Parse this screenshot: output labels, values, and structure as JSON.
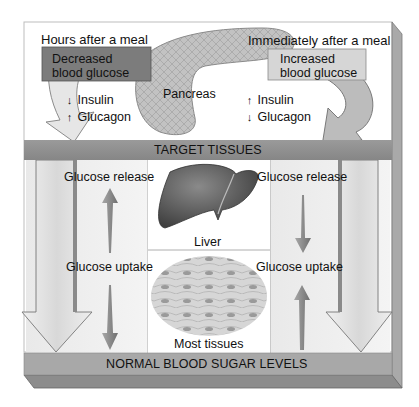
{
  "diagram": {
    "top_left_caption": "Hours after a meal",
    "top_right_caption": "Immediately after a meal",
    "left_box": {
      "line1": "Decreased",
      "line2": "blood glucose"
    },
    "right_box": {
      "line1": "Increased",
      "line2": "blood glucose"
    },
    "organ_label": "Pancreas",
    "left_hormones": [
      {
        "arrow": "↓",
        "direction": "down",
        "name": "Insulin"
      },
      {
        "arrow": "↑",
        "direction": "up",
        "name": "Glucagon"
      }
    ],
    "right_hormones": [
      {
        "arrow": "↑",
        "direction": "up",
        "name": "Insulin"
      },
      {
        "arrow": "↓",
        "direction": "down",
        "name": "Glucagon"
      }
    ],
    "target_band": "TARGET TISSUES",
    "bottom_band": "NORMAL BLOOD SUGAR LEVELS",
    "left_column": {
      "top_label": "Glucose release",
      "bottom_label": "Glucose uptake",
      "arrow_top": "up",
      "arrow_bottom": "down"
    },
    "right_column": {
      "top_label": "Glucose release",
      "bottom_label": "Glucose uptake",
      "arrow_top": "down",
      "arrow_bottom": "up"
    },
    "center_panels": [
      {
        "label": "Liver"
      },
      {
        "label": "Most tissues"
      }
    ],
    "colors": {
      "band": "#8f8f8f",
      "band_dark": "#6e6e6e",
      "dark_box": "#7a7a7a",
      "light_box": "#d4d4d4",
      "arrow_fill": "#dcdcdc",
      "arrow_stroke": "#707070",
      "liver": "#6a6a6a",
      "pancreas": "#bdbdbd"
    }
  }
}
